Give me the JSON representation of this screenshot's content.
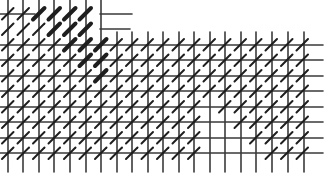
{
  "illustration": {
    "title": "Hatched grid pattern",
    "width": 328,
    "height": 177,
    "background": "#ffffff",
    "grid_color": "#3a3a3a",
    "hatch_color": "#1e1e1e",
    "grid": {
      "verticals": [
        8,
        23,
        39,
        54,
        70,
        86,
        101,
        117,
        132,
        148,
        163,
        179,
        194,
        210,
        225,
        241,
        256,
        272,
        288,
        304
      ],
      "vertical_top_left_region_end_x": 101,
      "vertical_top_right": 32,
      "vertical_bottom": 172,
      "horizontals": [
        {
          "y": 14,
          "x1": 0,
          "x2": 35
        },
        {
          "y": 14,
          "x1": 100,
          "x2": 132
        },
        {
          "y": 29,
          "x1": 100,
          "x2": 130
        },
        {
          "y": 45,
          "x1": 0,
          "x2": 323
        },
        {
          "y": 60,
          "x1": 0,
          "x2": 323
        },
        {
          "y": 76,
          "x1": 0,
          "x2": 323
        },
        {
          "y": 91,
          "x1": 0,
          "x2": 323
        },
        {
          "y": 107,
          "x1": 0,
          "x2": 323
        },
        {
          "y": 122,
          "x1": 0,
          "x2": 323
        },
        {
          "y": 138,
          "x1": 0,
          "x2": 323
        },
        {
          "y": 153,
          "x1": 0,
          "x2": 323
        }
      ]
    },
    "hatch": {
      "angle_deg": 45,
      "spacing": 15.5,
      "heavy_band": {
        "x_from": 20,
        "x_to": 105,
        "stroke": 4
      },
      "normal_stroke": 2
    }
  }
}
